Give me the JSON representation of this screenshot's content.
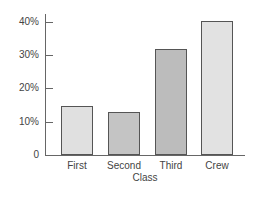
{
  "chart_data": {
    "type": "bar",
    "title": "",
    "xlabel": "Class",
    "ylabel": "",
    "categories": [
      "First",
      "Second",
      "Third",
      "Crew"
    ],
    "values": [
      14.8,
      12.9,
      31.9,
      40.2
    ],
    "ylim": [
      0,
      40
    ],
    "yticks": [
      "0",
      "10%",
      "20%",
      "30%",
      "40%"
    ],
    "grid": false,
    "legend": null,
    "bar_colors": [
      "#e0e0e0",
      "#c4c4c4",
      "#bcbcbc",
      "#e2e2e2"
    ]
  }
}
